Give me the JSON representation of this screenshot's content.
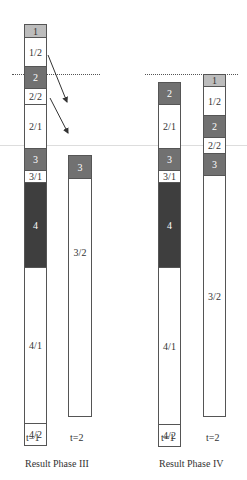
{
  "phase_iii": {
    "caption": "Result  Phase III",
    "t1_label": "t=1",
    "t2_label": "t=2",
    "t1_segments": [
      {
        "label": "1",
        "fill": "light"
      },
      {
        "label": "1/2",
        "fill": "none"
      },
      {
        "label": "2",
        "fill": "mid"
      },
      {
        "label": "2/2",
        "fill": "none"
      },
      {
        "label": "2/1",
        "fill": "none"
      },
      {
        "label": "3",
        "fill": "mid"
      },
      {
        "label": "3/1",
        "fill": "none"
      },
      {
        "label": "4",
        "fill": "dark"
      },
      {
        "label": "4/1",
        "fill": "none"
      },
      {
        "label": "4/2",
        "fill": "none"
      }
    ],
    "t2_segments": [
      {
        "label": "3",
        "fill": "mid"
      },
      {
        "label": "3/2",
        "fill": "none"
      }
    ]
  },
  "phase_iv": {
    "caption": "Result  Phase IV",
    "t1_label": "t=1",
    "t2_label": "t=2",
    "t1_segments": [
      {
        "label": "2",
        "fill": "mid"
      },
      {
        "label": "2/1",
        "fill": "none"
      },
      {
        "label": "3",
        "fill": "mid"
      },
      {
        "label": "3/1",
        "fill": "none"
      },
      {
        "label": "4",
        "fill": "dark"
      },
      {
        "label": "4/1",
        "fill": "none"
      },
      {
        "label": "4/2",
        "fill": "none"
      }
    ],
    "t2_segments": [
      {
        "label": "1",
        "fill": "light"
      },
      {
        "label": "1/2",
        "fill": "none"
      },
      {
        "label": "2",
        "fill": "mid"
      },
      {
        "label": "2/2",
        "fill": "none"
      },
      {
        "label": "3",
        "fill": "mid"
      },
      {
        "label": "3/2",
        "fill": "none"
      }
    ]
  },
  "colors": {
    "border": "#555555",
    "hatch_light": "#d9d9d9",
    "hatch_mid": "#c4c4c4",
    "hatch_dark": "#a8a8a8"
  }
}
